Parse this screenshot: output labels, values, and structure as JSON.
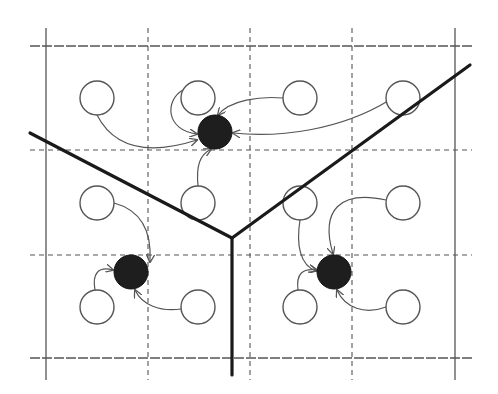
{
  "diagram": {
    "title": "",
    "width": 498,
    "height": 394,
    "colors": {
      "background": "#ffffff",
      "grid": "#555555",
      "boundary": "#1a1a1a",
      "arc": "#555555",
      "node_fill": "#ffffff",
      "node_stroke": "#555555",
      "centroid_fill": "#1e1e1e"
    },
    "grid": {
      "outer_horizontal_y": [
        46,
        358
      ],
      "inner_horizontal_y": [
        150,
        255
      ],
      "outer_vertical_x": [
        46,
        455
      ],
      "inner_vertical_x": [
        148,
        250,
        352
      ],
      "x_extent": [
        30,
        472
      ],
      "y_extent": [
        28,
        380
      ]
    },
    "nodes": [
      {
        "id": "n1",
        "cx": 97,
        "cy": 98
      },
      {
        "id": "n2",
        "cx": 198,
        "cy": 98
      },
      {
        "id": "n3",
        "cx": 300,
        "cy": 98
      },
      {
        "id": "n4",
        "cx": 403,
        "cy": 98
      },
      {
        "id": "n5",
        "cx": 97,
        "cy": 203
      },
      {
        "id": "n6",
        "cx": 198,
        "cy": 203
      },
      {
        "id": "n7",
        "cx": 300,
        "cy": 203
      },
      {
        "id": "n8",
        "cx": 403,
        "cy": 203
      },
      {
        "id": "n9",
        "cx": 97,
        "cy": 307
      },
      {
        "id": "n10",
        "cx": 198,
        "cy": 307
      },
      {
        "id": "n11",
        "cx": 300,
        "cy": 307
      },
      {
        "id": "n12",
        "cx": 403,
        "cy": 307
      }
    ],
    "node_radius": 17,
    "centroids": [
      {
        "id": "c_top",
        "cx": 215,
        "cy": 132
      },
      {
        "id": "c_left",
        "cx": 131,
        "cy": 272
      },
      {
        "id": "c_right",
        "cx": 334,
        "cy": 272
      }
    ],
    "centroid_radius": 17,
    "boundaries": [
      {
        "id": "b_left",
        "x1": 30,
        "y1": 133,
        "x2": 232,
        "y2": 238
      },
      {
        "id": "b_right",
        "x1": 232,
        "y1": 238,
        "x2": 470,
        "y2": 65
      },
      {
        "id": "b_bottom",
        "x1": 232,
        "y1": 238,
        "x2": 232,
        "y2": 375
      }
    ],
    "arcs": [
      {
        "from": "n1",
        "to": "c_top",
        "d": "M97,115 C115,150 150,155 197,140"
      },
      {
        "from": "n2",
        "to": "c_top",
        "d": "M183,90 C165,100 165,130 197,134"
      },
      {
        "from": "n3",
        "to": "c_top",
        "d": "M283,98 C260,96 230,100 218,115"
      },
      {
        "from": "n4",
        "to": "c_top",
        "d": "M388,101 C340,130 280,138 233,133"
      },
      {
        "from": "n6",
        "to": "c_top",
        "d": "M198,186 C196,165 200,155 211,149"
      },
      {
        "from": "n5",
        "to": "c_left",
        "d": "M114,203 C140,210 152,230 150,262"
      },
      {
        "from": "n9",
        "to": "c_left",
        "d": "M95,290 C92,274 98,266 113,270"
      },
      {
        "from": "n10",
        "to": "c_left",
        "d": "M181,309 C160,312 142,305 135,290"
      },
      {
        "from": "n7",
        "to": "c_right",
        "d": "M300,220 C296,245 300,265 316,271"
      },
      {
        "from": "n8",
        "to": "c_right",
        "d": "M386,200 C340,190 320,210 333,254"
      },
      {
        "from": "n11",
        "to": "c_right",
        "d": "M298,290 C296,274 302,268 317,270"
      },
      {
        "from": "n12",
        "to": "c_right",
        "d": "M386,307 C365,315 345,308 337,290"
      }
    ]
  }
}
